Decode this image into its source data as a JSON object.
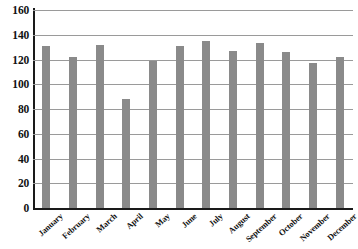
{
  "chart_data": {
    "type": "bar",
    "title": "",
    "subtitle": "",
    "xlabel": "",
    "ylabel": "",
    "categories": [
      "January",
      "February",
      "March",
      "April",
      "May",
      "June",
      "July",
      "August",
      "September",
      "October",
      "November",
      "December"
    ],
    "values": [
      131,
      122,
      132,
      88,
      119,
      131,
      135,
      127,
      133,
      126,
      117,
      122
    ],
    "series": [
      {
        "name": "",
        "values": [
          131,
          122,
          132,
          88,
          119,
          131,
          135,
          127,
          133,
          126,
          117,
          122
        ]
      }
    ],
    "ylim": [
      0,
      160
    ],
    "xlim": [
      0,
      12
    ],
    "y_ticks": [
      0,
      20,
      40,
      60,
      80,
      100,
      120,
      140,
      160
    ],
    "y_tick_labels": [
      "0",
      "20",
      "40",
      "60",
      "80",
      "100",
      "120",
      "140",
      "160"
    ],
    "grid": true,
    "grid_axis": "y",
    "legend": false,
    "legend_position": "none",
    "bar_color": "#8a8a8a",
    "grid_color": "#9a9a9a",
    "axis_color": "#1a1a1a",
    "background_color": "#ffffff",
    "x_label_rotation": -42,
    "annotations": []
  }
}
